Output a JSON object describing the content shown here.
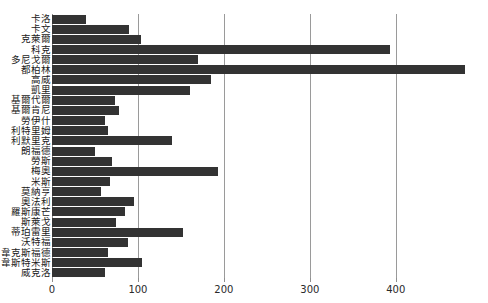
{
  "chart_data": {
    "type": "bar",
    "orientation": "horizontal",
    "title": "",
    "xlabel": "",
    "ylabel": "",
    "xlim": [
      0,
      490
    ],
    "xticks": [
      0,
      100,
      200,
      300,
      400
    ],
    "xtick_labels": [
      "0",
      "100",
      "200",
      "300",
      "400"
    ],
    "grid": "vertical",
    "legend": "none",
    "bar_color": "#333333",
    "grid_color": "#9a9a9a",
    "background_color": "#ffffff",
    "categories": [
      "卡洛",
      "卡文",
      "克萊爾",
      "科克",
      "多尼戈爾",
      "都柏林",
      "高威",
      "凱里",
      "基爾代爾",
      "基爾肯尼",
      "勞伊什",
      "利特里姆",
      "利默里克",
      "朗福德",
      "勞斯",
      "梅奧",
      "米斯",
      "莫納亨",
      "奧法利",
      "羅斯康芒",
      "斯萊戈",
      "蒂珀雷里",
      "沃特福",
      "韋克斯福德",
      "韋斯特米斯",
      "威克洛"
    ],
    "values": [
      40,
      90,
      103,
      393,
      170,
      480,
      185,
      160,
      73,
      78,
      62,
      65,
      140,
      50,
      70,
      193,
      68,
      57,
      95,
      85,
      75,
      152,
      88,
      65,
      105,
      62
    ]
  },
  "axis": {
    "x_ticks": [
      {
        "value": 0,
        "label": "0"
      },
      {
        "value": 100,
        "label": "100"
      },
      {
        "value": 200,
        "label": "200"
      },
      {
        "value": 300,
        "label": "300"
      },
      {
        "value": 400,
        "label": "400"
      }
    ]
  }
}
